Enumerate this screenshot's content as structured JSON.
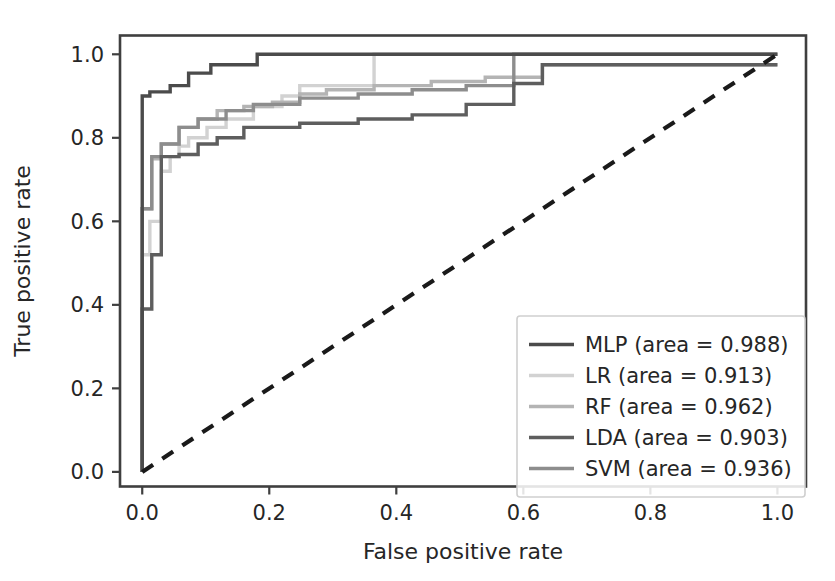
{
  "figure": {
    "width": 835,
    "height": 581,
    "background": "#ffffff"
  },
  "axes": {
    "xlabel": "False positive rate",
    "ylabel": "True positive rate",
    "x_ticks": [
      "0.0",
      "0.2",
      "0.4",
      "0.6",
      "0.8",
      "1.0"
    ],
    "y_ticks": [
      "0.0",
      "0.2",
      "0.4",
      "0.6",
      "0.8",
      "1.0"
    ],
    "x_tick_values": [
      0.0,
      0.2,
      0.4,
      0.6,
      0.8,
      1.0
    ],
    "y_tick_values": [
      0.0,
      0.2,
      0.4,
      0.6,
      0.8,
      1.0
    ],
    "xlim": [
      -0.035,
      1.045
    ],
    "ylim": [
      -0.035,
      1.045
    ],
    "spine_color": "#3f3f3f",
    "tick_color": "#3f3f3f",
    "label_color": "#262626",
    "grid": false
  },
  "legend": {
    "position": "lower right",
    "border_color": "#cfcfcf",
    "background": "#ffffff",
    "entries": [
      {
        "label": "MLP (area = 0.988)",
        "color": "#4b4b4b",
        "series": "MLP"
      },
      {
        "label": "LR (area = 0.913)",
        "color": "#d2d2d2",
        "series": "LR"
      },
      {
        "label": "RF (area = 0.962)",
        "color": "#b4b4b4",
        "series": "RF"
      },
      {
        "label": "LDA (area = 0.903)",
        "color": "#5e5e5e",
        "series": "LDA"
      },
      {
        "label": "SVM (area = 0.936)",
        "color": "#8d8d8d",
        "series": "SVM"
      }
    ]
  },
  "chart_data": {
    "type": "line",
    "title": "",
    "xlabel": "False positive rate",
    "ylabel": "True positive rate",
    "xlim": [
      0.0,
      1.0
    ],
    "ylim": [
      0.0,
      1.0
    ],
    "grid": false,
    "legend_position": "lower right",
    "chance_line": {
      "label": "chance",
      "style": "dashed",
      "color": "#1a1a1a",
      "x": [
        0.0,
        1.0
      ],
      "y": [
        0.0,
        1.0
      ]
    },
    "series": [
      {
        "name": "MLP",
        "auc": 0.988,
        "color": "#4b4b4b",
        "drawstyle": "steps-post",
        "x": [
          0.0,
          0.0,
          0.0,
          0.012,
          0.012,
          0.044,
          0.044,
          0.073,
          0.073,
          0.108,
          0.108,
          0.181,
          0.181,
          1.0
        ],
        "y": [
          0.0,
          0.29,
          0.9,
          0.9,
          0.91,
          0.91,
          0.925,
          0.925,
          0.955,
          0.955,
          0.975,
          0.975,
          1.0,
          1.0
        ]
      },
      {
        "name": "LR",
        "auc": 0.913,
        "color": "#d2d2d2",
        "drawstyle": "steps-post",
        "x": [
          0.0,
          0.0,
          0.012,
          0.012,
          0.03,
          0.03,
          0.044,
          0.044,
          0.058,
          0.058,
          0.073,
          0.073,
          0.102,
          0.102,
          0.132,
          0.132,
          0.175,
          0.175,
          0.22,
          0.22,
          0.248,
          0.248,
          0.365,
          0.365,
          1.0
        ],
        "y": [
          0.0,
          0.52,
          0.52,
          0.6,
          0.6,
          0.72,
          0.72,
          0.755,
          0.755,
          0.78,
          0.78,
          0.8,
          0.8,
          0.825,
          0.825,
          0.845,
          0.845,
          0.875,
          0.875,
          0.9,
          0.9,
          0.925,
          0.925,
          1.0,
          1.0
        ]
      },
      {
        "name": "RF",
        "auc": 0.962,
        "color": "#b4b4b4",
        "drawstyle": "steps-post",
        "x": [
          0.0,
          0.0,
          0.015,
          0.015,
          0.03,
          0.03,
          0.058,
          0.058,
          0.088,
          0.088,
          0.118,
          0.118,
          0.16,
          0.16,
          0.205,
          0.205,
          0.248,
          0.248,
          0.29,
          0.29,
          0.365,
          0.365,
          0.455,
          0.455,
          0.54,
          0.54,
          0.63,
          0.63,
          1.0
        ],
        "y": [
          0.0,
          0.63,
          0.63,
          0.75,
          0.75,
          0.785,
          0.785,
          0.825,
          0.825,
          0.845,
          0.845,
          0.865,
          0.865,
          0.875,
          0.875,
          0.885,
          0.885,
          0.905,
          0.905,
          0.915,
          0.915,
          0.925,
          0.925,
          0.935,
          0.935,
          0.945,
          0.945,
          0.975,
          0.975
        ]
      },
      {
        "name": "LDA",
        "auc": 0.903,
        "color": "#5e5e5e",
        "drawstyle": "steps-post",
        "x": [
          0.0,
          0.0,
          0.015,
          0.015,
          0.03,
          0.03,
          0.058,
          0.058,
          0.088,
          0.088,
          0.118,
          0.118,
          0.16,
          0.16,
          0.248,
          0.248,
          0.34,
          0.34,
          0.425,
          0.425,
          0.51,
          0.51,
          0.585,
          0.585,
          0.63,
          0.63,
          1.0
        ],
        "y": [
          0.0,
          0.39,
          0.39,
          0.52,
          0.52,
          0.755,
          0.755,
          0.76,
          0.76,
          0.785,
          0.785,
          0.8,
          0.8,
          0.825,
          0.825,
          0.835,
          0.835,
          0.845,
          0.845,
          0.855,
          0.855,
          0.88,
          0.88,
          0.93,
          0.93,
          0.975,
          0.975
        ]
      },
      {
        "name": "SVM",
        "auc": 0.936,
        "color": "#8d8d8d",
        "drawstyle": "steps-post",
        "x": [
          0.0,
          0.0,
          0.015,
          0.015,
          0.03,
          0.03,
          0.058,
          0.058,
          0.088,
          0.088,
          0.132,
          0.132,
          0.175,
          0.175,
          0.248,
          0.248,
          0.34,
          0.34,
          0.425,
          0.425,
          0.51,
          0.51,
          0.585,
          0.585,
          1.0
        ],
        "y": [
          0.0,
          0.63,
          0.63,
          0.755,
          0.755,
          0.785,
          0.785,
          0.825,
          0.825,
          0.845,
          0.845,
          0.865,
          0.865,
          0.88,
          0.88,
          0.895,
          0.895,
          0.905,
          0.905,
          0.915,
          0.915,
          0.925,
          0.925,
          1.0,
          1.0
        ]
      }
    ]
  }
}
